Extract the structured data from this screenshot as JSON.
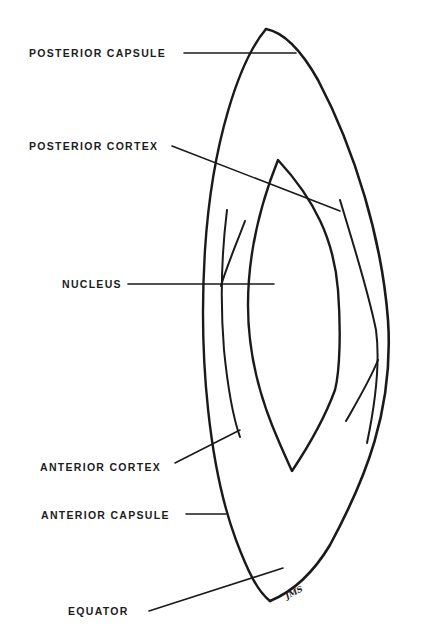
{
  "diagram": {
    "labels": [
      {
        "id": "posterior-capsule",
        "text": "POSTERIOR CAPSULE",
        "x": 29,
        "y": 49
      },
      {
        "id": "posterior-cortex",
        "text": "POSTERIOR CORTEX",
        "x": 29,
        "y": 140
      },
      {
        "id": "nucleus",
        "text": "NUCLEUS",
        "x": 62,
        "y": 279
      },
      {
        "id": "anterior-cortex",
        "text": "ANTERIOR CORTEX",
        "x": 40,
        "y": 460
      },
      {
        "id": "anterior-capsule",
        "text": "ANTERIOR CAPSULE",
        "x": 41,
        "y": 509
      },
      {
        "id": "equator",
        "text": "EQUATOR",
        "x": 68,
        "y": 607
      }
    ],
    "signature": "JMS",
    "colors": {
      "ink": "#1a1a1a",
      "background": "#ffffff"
    }
  }
}
